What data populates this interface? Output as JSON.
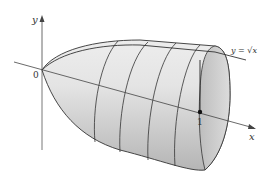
{
  "diagram": {
    "labels": {
      "y_axis": "y",
      "x_axis": "x",
      "origin": "0",
      "tick_x": "1",
      "curve": "y = √x"
    },
    "colors": {
      "axis": "#444444",
      "outline": "#333333",
      "surface_light": "#f2f2f2",
      "surface_dark": "#b8b8b8",
      "end_face": "#d0d0d0"
    },
    "cross_sections": 4
  }
}
